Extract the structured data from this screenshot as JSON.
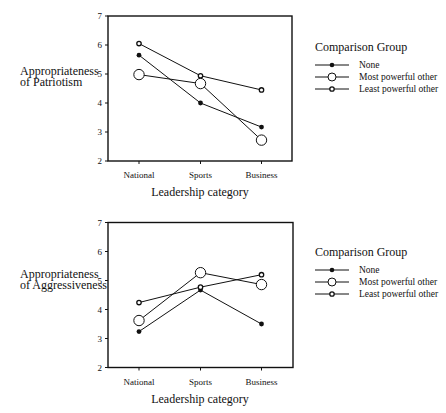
{
  "chart_data": [
    {
      "type": "line",
      "title": "",
      "xlabel": "Leadership category",
      "ylabel": "Appropriateness of Patriotism",
      "ylabel_lines": [
        "Appropriateness",
        "of Patriotism"
      ],
      "categories": [
        "National",
        "Sports",
        "Business"
      ],
      "ylim": [
        2,
        7
      ],
      "yticks": [
        "2",
        "3",
        "4",
        "5",
        "6",
        "7"
      ],
      "grid": false,
      "legend_position": "right",
      "legend_title": "Comparison Group",
      "series": [
        {
          "name": "None",
          "marker": "filled-small",
          "values": [
            5.65,
            4.0,
            3.17
          ]
        },
        {
          "name": "Most powerful other",
          "marker": "open-large",
          "values": [
            4.98,
            4.67,
            2.72
          ]
        },
        {
          "name": "Least powerful other",
          "marker": "open-small",
          "values": [
            6.05,
            4.94,
            4.45
          ]
        }
      ]
    },
    {
      "type": "line",
      "title": "",
      "xlabel": "Leadership category",
      "ylabel": "Appropriateness of Aggressiveness",
      "ylabel_lines": [
        "Appropriateness",
        "of Aggressiveness"
      ],
      "categories": [
        "National",
        "Sports",
        "Business"
      ],
      "ylim": [
        2,
        7
      ],
      "yticks": [
        "2",
        "3",
        "4",
        "5",
        "6",
        "7"
      ],
      "grid": false,
      "legend_position": "right",
      "legend_title": "Comparison Group",
      "series": [
        {
          "name": "None",
          "marker": "filled-small",
          "values": [
            3.24,
            4.67,
            3.5
          ]
        },
        {
          "name": "Most powerful other",
          "marker": "open-large",
          "values": [
            3.62,
            5.27,
            4.86
          ]
        },
        {
          "name": "Least powerful other",
          "marker": "open-small",
          "values": [
            4.24,
            4.77,
            5.2
          ]
        }
      ]
    }
  ],
  "panels": [
    {
      "ylabel_line1": "Appropriateness",
      "ylabel_line2": "of Patriotism",
      "xlabel": "Leadership category",
      "legend_title": "Comparison Group",
      "legend": [
        "None",
        "Most powerful other",
        "Least powerful other"
      ]
    },
    {
      "ylabel_line1": "Appropriateness",
      "ylabel_line2": "of Aggressiveness",
      "xlabel": "Leadership category",
      "legend_title": "Comparison Group",
      "legend": [
        "None",
        "Most powerful other",
        "Least powerful other"
      ]
    }
  ],
  "colors": {
    "ink": "#111111",
    "background": "#ffffff"
  }
}
